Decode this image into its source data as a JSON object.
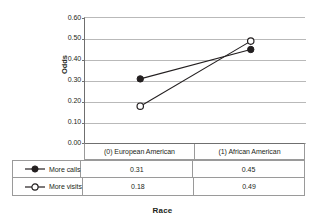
{
  "chart_data": {
    "type": "line",
    "title": "",
    "xlabel": "Race",
    "ylabel": "Odds",
    "categories": [
      "(0) European American",
      "(1) African  American"
    ],
    "series": [
      {
        "name": "More calls",
        "values": [
          0.31,
          0.45
        ],
        "marker": "filled-circle"
      },
      {
        "name": "More visits",
        "values": [
          0.18,
          0.49
        ],
        "marker": "open-circle"
      }
    ],
    "ylim": [
      0.0,
      0.6
    ],
    "ytick_labels": [
      "0.60",
      "0.50",
      "0.40",
      "0.30",
      "0.20",
      "0.10",
      "0.00"
    ],
    "ytick_values": [
      0.6,
      0.5,
      0.4,
      0.3,
      0.2,
      0.1,
      0.0
    ],
    "grid": "horizontal",
    "legend_position": "bottom-table",
    "value_labels": [
      [
        "0.31",
        "0.45"
      ],
      [
        "0.18",
        "0.49"
      ]
    ],
    "line_color": "#231f20",
    "grid_color": "#b9b9b9"
  }
}
